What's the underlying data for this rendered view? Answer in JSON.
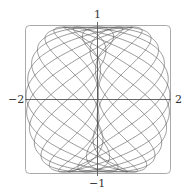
{
  "chart_data": {
    "type": "line",
    "title": "",
    "xlabel": "",
    "ylabel": "",
    "parametric": {
      "x_expr": "sin(t) - sin(2.3*t)",
      "y_expr": "cos(t)",
      "t_range": [
        0,
        62.83
      ],
      "samples": 4000
    },
    "xlim": [
      -2,
      2
    ],
    "ylim": [
      -1,
      1
    ],
    "grid": false,
    "axes_through_origin": true,
    "tick_labels": {
      "x_left": "−2",
      "x_right": "2",
      "y_top": "1",
      "y_bottom": "−1"
    },
    "frame": "rounded-box",
    "line_color": "#555555",
    "axis_color": "#666666"
  }
}
